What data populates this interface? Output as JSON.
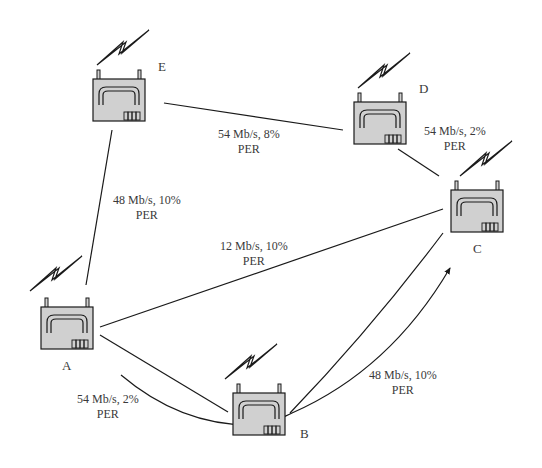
{
  "diagram": {
    "type": "wireless mesh network",
    "colors": {
      "router_fill": "#d0d0d0",
      "stroke": "#1a1a1a",
      "text": "#3a3a3a",
      "background": "#ffffff"
    },
    "nodes": [
      {
        "id": "A",
        "label": "A",
        "icon": "wireless-router-icon"
      },
      {
        "id": "B",
        "label": "B",
        "icon": "wireless-router-icon"
      },
      {
        "id": "C",
        "label": "C",
        "icon": "wireless-router-icon"
      },
      {
        "id": "D",
        "label": "D",
        "icon": "wireless-router-icon"
      },
      {
        "id": "E",
        "label": "E",
        "icon": "wireless-router-icon"
      }
    ],
    "links": [
      {
        "from": "E",
        "to": "D",
        "rate": "54 Mb/s, 8%",
        "suffix": "PER"
      },
      {
        "from": "D",
        "to": "C",
        "rate": "54 Mb/s, 2%",
        "suffix": "PER"
      },
      {
        "from": "E",
        "to": "A",
        "rate": "48 Mb/s, 10%",
        "suffix": "PER"
      },
      {
        "from": "A",
        "to": "C",
        "rate": "12 Mb/s, 10%",
        "suffix": "PER"
      },
      {
        "from": "A",
        "to": "B",
        "rate": "54 Mb/s, 2%",
        "suffix": "PER"
      },
      {
        "from": "B",
        "to": "C",
        "rate": "48 Mb/s, 10%",
        "suffix": "PER"
      }
    ],
    "route": {
      "path": [
        "A",
        "B",
        "C"
      ],
      "arrow": "arrow-to-C"
    }
  }
}
